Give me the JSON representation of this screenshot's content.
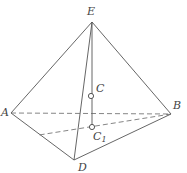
{
  "figure": {
    "type": "pyramid",
    "vertices": {
      "E": {
        "label": "E",
        "x": 92,
        "y": 22
      },
      "A": {
        "label": "A",
        "x": 11,
        "y": 113
      },
      "B": {
        "label": "B",
        "x": 171,
        "y": 114
      },
      "D": {
        "label": "D",
        "x": 74,
        "y": 160
      }
    },
    "points": {
      "C": {
        "label": "C",
        "x": 91,
        "y": 96
      },
      "C1": {
        "label": "C",
        "subscript": "1",
        "x": 92,
        "y": 127
      }
    },
    "edges_solid": [
      "EA",
      "EB",
      "ED",
      "AD",
      "DB",
      "EC1"
    ],
    "edges_dashed": [
      "AB",
      "B-to-AD-point"
    ],
    "dashed_endpoint_on_AD": {
      "x": 39,
      "y": 135
    }
  }
}
